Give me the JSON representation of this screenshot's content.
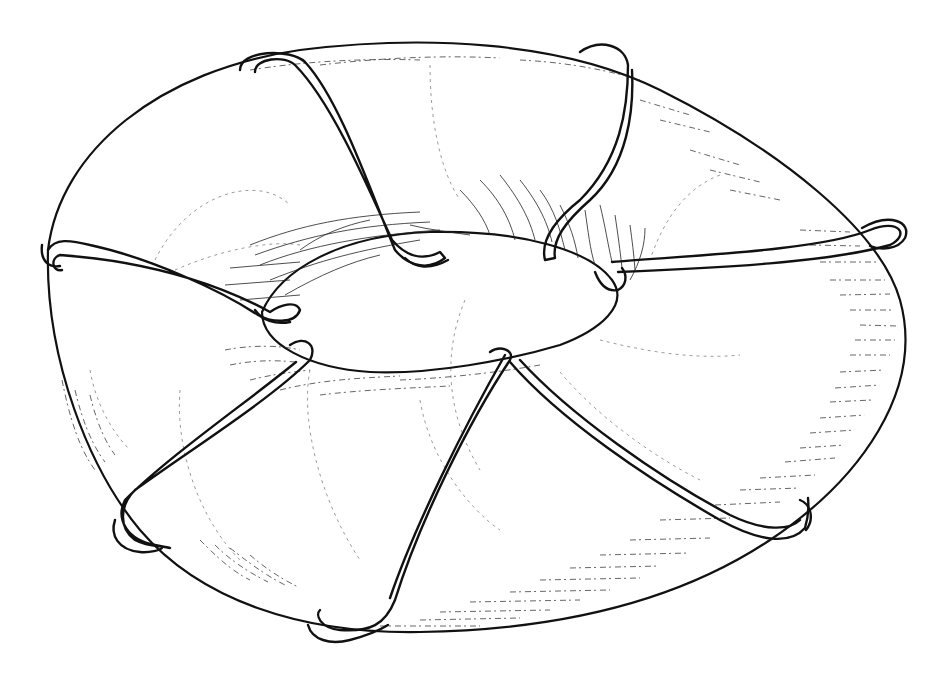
{
  "illustration": {
    "subject": "toroidal coil",
    "description": "Hand-drawn ink sketch of a torus with six looped wire windings wrapped around the ring",
    "ink_color": "#111111",
    "paper_color": "#ffffff",
    "torus": {
      "outer_outline": "M 48 250 C 60 150, 160 70, 300 50 C 420 35, 560 40, 660 90 C 780 150, 880 230, 900 300 C 925 390, 860 480, 770 540 C 680 600, 560 630, 420 632 C 300 634, 200 600, 140 530 C 90 470, 45 360, 48 250 Z",
      "inner_hole": "M 262 312 C 280 270, 340 235, 430 232 C 520 230, 590 250, 612 280 C 630 305, 600 330, 560 345 C 510 360, 430 375, 370 372 C 310 368, 262 345, 262 312 Z"
    },
    "coils": [
      {
        "name": "coil-top-left",
        "path": "M 240 70 C 240 50, 290 48, 305 62 C 340 100, 370 190, 395 250 C 410 268, 430 270, 445 258 L 440 252 C 420 262, 405 255, 392 240 C 365 180, 330 100, 295 65 C 285 55, 255 58, 255 72"
      },
      {
        "name": "coil-top-right",
        "path": "M 580 52 C 600 38, 625 45, 628 65 C 628 110, 620 160, 580 200 C 555 220, 540 240, 545 260 L 555 258 C 552 240, 565 222, 590 200 C 628 165, 634 110, 632 70"
      },
      {
        "name": "coil-right",
        "path": "M 612 262 C 700 255, 820 250, 870 230 C 900 218, 910 235, 890 245 C 830 262, 720 268, 618 272"
      },
      {
        "name": "coil-left",
        "path": "M 48 250 C 55 238, 70 240, 90 245 C 150 258, 220 290, 258 315 C 270 322, 295 325, 300 310 C 296 300, 280 305, 270 312 C 230 290, 160 262, 60 255 C 50 258, 52 272, 62 270"
      },
      {
        "name": "coil-bottom-left",
        "path": "M 290 345 C 305 335, 318 345, 310 360 C 270 400, 190 450, 135 490 C 120 505, 118 528, 135 540 C 150 548, 160 545, 170 548 L 155 545 C 128 540, 115 520, 125 500 C 170 455, 250 400, 296 362"
      },
      {
        "name": "coil-bottom-center",
        "path": "M 490 352 C 500 345, 515 350, 510 360 C 470 420, 420 520, 395 600 C 385 625, 370 632, 340 630 C 320 628, 315 615, 320 610 M 505 355 C 465 425, 415 525, 390 598"
      },
      {
        "name": "coil-bottom-right",
        "path": "M 510 362 C 560 420, 650 480, 720 520 C 760 542, 790 545, 805 528 C 810 512, 808 500, 808 498 M 520 360 C 570 415, 660 478, 730 515 C 765 532, 790 530, 800 520"
      }
    ],
    "hatch_groups": [
      {
        "name": "inner-hole-top-hatching",
        "region": "upper inner rim",
        "x": 240,
        "y": 200,
        "width": 420,
        "height": 120
      },
      {
        "name": "right-edge-hatching",
        "region": "outer right rim",
        "x": 740,
        "y": 210,
        "width": 180,
        "height": 330
      },
      {
        "name": "bottom-edge-hatching",
        "region": "outer bottom rim",
        "x": 420,
        "y": 560,
        "width": 380,
        "height": 80
      },
      {
        "name": "lower-left-hatching",
        "region": "lower left rim",
        "x": 60,
        "y": 350,
        "width": 320,
        "height": 280
      }
    ],
    "labels": []
  }
}
